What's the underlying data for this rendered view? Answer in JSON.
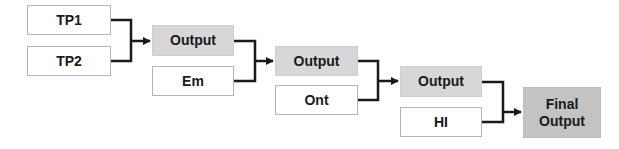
{
  "diagram": {
    "stage1": {
      "inputs": [
        "TP1",
        "TP2"
      ]
    },
    "stage2": {
      "output": "Output",
      "input": "Em"
    },
    "stage3": {
      "output": "Output",
      "input": "Ont"
    },
    "stage4": {
      "output": "Output",
      "input": "HI"
    },
    "final": {
      "line1": "Final",
      "line2": "Output"
    }
  },
  "colors": {
    "input_box": "#ffffff",
    "output_box": "#d7d7d7",
    "final_box": "#c3c3c3",
    "connector": "#1a1a1a"
  }
}
